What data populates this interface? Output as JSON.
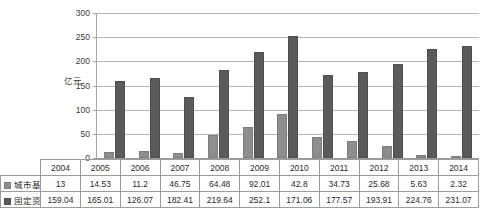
{
  "chart_data": {
    "type": "bar",
    "title": "",
    "xlabel": "",
    "ylabel": "亿元",
    "ylim": [
      0,
      300
    ],
    "yticks": [
      0,
      50,
      100,
      150,
      200,
      250,
      300
    ],
    "grid": true,
    "legend_position": "table-left",
    "categories": [
      "2004",
      "2005",
      "2006",
      "2007",
      "2008",
      "2009",
      "2010",
      "2011",
      "2012",
      "2013",
      "2014"
    ],
    "series": [
      {
        "name": "城市基础设施投资额",
        "color": "#8e8e8e",
        "values": [
          13,
          14.53,
          11.2,
          46.75,
          64.48,
          92.01,
          42.8,
          34.73,
          25.68,
          5.63,
          2.32
        ],
        "value_labels": [
          "13",
          "14.53",
          "11.2",
          "46.75",
          "64.48",
          "92.01",
          "42.8",
          "34.73",
          "25.68",
          "5.63",
          "2.32"
        ]
      },
      {
        "name": "固定资产投资额",
        "color": "#5b5b5b",
        "values": [
          159.04,
          165.01,
          126.07,
          182.41,
          219.64,
          252.1,
          171.06,
          177.57,
          193.91,
          224.76,
          231.07
        ],
        "value_labels": [
          "159.04",
          "165.01",
          "126.07",
          "182.41",
          "219.64",
          "252.1",
          "171.06",
          "177.57",
          "193.91",
          "224.76",
          "231.07"
        ]
      }
    ]
  },
  "axis": {
    "y_title": "亿元",
    "tick_labels": [
      "300",
      "250",
      "200",
      "150",
      "100",
      "50",
      "0"
    ]
  },
  "table": {
    "row_headers": [
      "城市基础设施投资额",
      "固定资产投资额"
    ]
  }
}
